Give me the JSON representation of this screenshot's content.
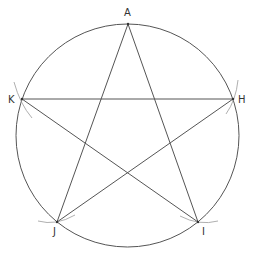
{
  "diagram": {
    "colors": {
      "background": "#ffffff",
      "stroke": "#555555",
      "construction": "#9a9a9a",
      "label": "#333333"
    },
    "circle": {
      "cx": 127.5,
      "cy": 135.5,
      "r": 111.5
    },
    "vertices": {
      "A": {
        "x": 128,
        "y": 24
      },
      "H": {
        "x": 233,
        "y": 99
      },
      "I": {
        "x": 198,
        "y": 222
      },
      "J": {
        "x": 57,
        "y": 222
      },
      "K": {
        "x": 22,
        "y": 99
      }
    },
    "labels": {
      "A": {
        "text": "A",
        "x": 124,
        "y": 16
      },
      "H": {
        "text": "H",
        "x": 238,
        "y": 103
      },
      "I": {
        "text": "I",
        "x": 202,
        "y": 235
      },
      "J": {
        "text": "J",
        "x": 53,
        "y": 235
      },
      "K": {
        "text": "K",
        "x": 8,
        "y": 103
      }
    },
    "segments": [
      {
        "from": "A",
        "to": "J"
      },
      {
        "from": "A",
        "to": "I"
      },
      {
        "from": "K",
        "to": "H"
      },
      {
        "from": "K",
        "to": "I"
      },
      {
        "from": "H",
        "to": "J"
      }
    ],
    "construction_arcs": [
      {
        "at": "K",
        "d": "M 14 82 Q 20 104 32 118"
      },
      {
        "at": "H",
        "d": "M 238 80 Q 236 100 226 114"
      },
      {
        "at": "J",
        "d": "M 38 221 Q 56 226 75 215"
      },
      {
        "at": "I",
        "d": "M 180 216 Q 199 226 218 221"
      }
    ]
  }
}
